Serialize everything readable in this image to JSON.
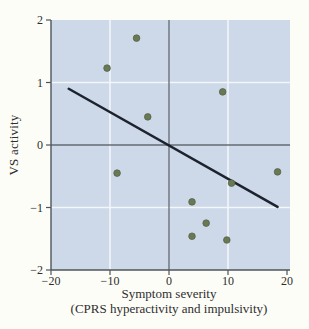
{
  "figure": {
    "kind": "textbook-scatter-figure"
  },
  "chart_data": {
    "type": "scatter",
    "title": "",
    "xlabel": "Symptom severity (CPRS hyperactivity and impulsivity)",
    "xlabel_line1": "Symptom severity",
    "xlabel_line2": "(CPRS hyperactivity and impulsivity)",
    "ylabel": "VS activity",
    "xlim": [
      -20,
      20
    ],
    "ylim": [
      -2,
      2
    ],
    "xticks": [
      {
        "value": -20,
        "label": "−20"
      },
      {
        "value": -10,
        "label": "−10"
      },
      {
        "value": 0,
        "label": "0"
      },
      {
        "value": 10,
        "label": "10"
      },
      {
        "value": 20,
        "label": "20"
      }
    ],
    "yticks": [
      {
        "value": -2,
        "label": "−2"
      },
      {
        "value": -1,
        "label": "−1"
      },
      {
        "value": 0,
        "label": "0"
      },
      {
        "value": 1,
        "label": "1"
      },
      {
        "value": 2,
        "label": "2"
      }
    ],
    "grid": {
      "x_values": [
        -10,
        10
      ],
      "y_values": [
        -1,
        1
      ],
      "visible": true
    },
    "zero_lines": {
      "x": 0,
      "y": 0
    },
    "points": [
      {
        "x": -10.5,
        "y": 1.23
      },
      {
        "x": -5.5,
        "y": 1.71
      },
      {
        "x": -3.6,
        "y": 0.45
      },
      {
        "x": 9.1,
        "y": 0.85
      },
      {
        "x": -8.8,
        "y": -0.45
      },
      {
        "x": 18.4,
        "y": -0.43
      },
      {
        "x": 10.6,
        "y": -0.61
      },
      {
        "x": 3.9,
        "y": -0.91
      },
      {
        "x": 6.3,
        "y": -1.25
      },
      {
        "x": 3.9,
        "y": -1.46
      },
      {
        "x": 9.8,
        "y": -1.52
      }
    ],
    "trend_line": {
      "x1": -17.0,
      "y1": 0.9,
      "x2": 18.4,
      "y2": -0.99
    },
    "legend": null,
    "colors": {
      "figure_bg": "#fdfdf8",
      "plot_bg": "#cdd9e8",
      "grid": "#f3f7fa",
      "zero_line": "#636a72",
      "axis": "#4e545b",
      "trend": "#1c232e",
      "point_fill": "#6a7954",
      "point_stroke": "#55634a",
      "text": "#2e2e2e"
    }
  }
}
